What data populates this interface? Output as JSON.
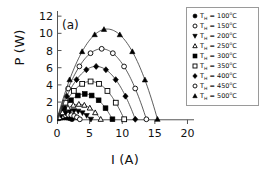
{
  "figure": {
    "panel_label": "(a)"
  },
  "chart_data": {
    "type": "line",
    "title": "",
    "xlabel": "I (A)",
    "ylabel": "P (W)",
    "xlim": [
      0,
      21
    ],
    "ylim": [
      -0.55,
      12.6
    ],
    "xticks": [
      0,
      5,
      10,
      15,
      20
    ],
    "yticks": [
      0,
      2,
      4,
      6,
      8,
      10,
      12
    ],
    "xtick_labels": [
      "0",
      "5",
      "10",
      "15",
      "20"
    ],
    "ytick_labels": [
      "0",
      "2",
      "4",
      "6",
      "8",
      "10",
      "12"
    ],
    "grid": false,
    "legend_position": "upper right",
    "line_color": "#333333",
    "marker_color": "#000000",
    "axis_color": "#555555",
    "series": [
      {
        "name": "T_H = 100°C",
        "label_prefix": "T",
        "label_sub": "H",
        "label_value": " = 100",
        "label_unit": "°C",
        "marker": "filled-circle",
        "i_peak": 1.15,
        "p_peak": 0.22,
        "i_end": 2.3,
        "points_i": [
          0.29,
          0.58,
          0.86,
          1.15,
          1.44,
          1.73,
          2.01,
          2.3
        ],
        "points_p": [
          0.15,
          0.2,
          0.22,
          0.22,
          0.2,
          0.15,
          0.09,
          0.0
        ]
      },
      {
        "name": "T_H = 150°C",
        "label_prefix": "T",
        "label_sub": "H",
        "label_value": " = 150",
        "label_unit": "°C",
        "marker": "open-circle",
        "i_peak": 1.75,
        "p_peak": 0.52,
        "i_end": 3.5,
        "points_i": [
          0.44,
          0.88,
          1.31,
          1.75,
          2.19,
          2.63,
          3.06,
          3.5
        ],
        "points_p": [
          0.34,
          0.46,
          0.52,
          0.52,
          0.46,
          0.34,
          0.2,
          0.0
        ]
      },
      {
        "name": "T_H = 200°C",
        "label_prefix": "T",
        "label_sub": "H",
        "label_value": " = 200",
        "label_unit": "°C",
        "marker": "filled-triangle-down",
        "i_peak": 2.6,
        "p_peak": 1.0,
        "i_end": 5.2,
        "points_i": [
          0.65,
          1.3,
          1.95,
          2.6,
          3.25,
          3.9,
          4.55,
          5.2
        ],
        "points_p": [
          0.66,
          0.89,
          1.0,
          1.0,
          0.89,
          0.66,
          0.39,
          0.0
        ]
      },
      {
        "name": "T_H = 250°C",
        "label_prefix": "T",
        "label_sub": "H",
        "label_value": " = 250",
        "label_unit": "°C",
        "marker": "open-triangle-up",
        "i_peak": 3.35,
        "p_peak": 1.75,
        "i_end": 6.7,
        "points_i": [
          0.84,
          1.68,
          2.51,
          3.35,
          4.19,
          5.03,
          5.86,
          6.7
        ],
        "points_p": [
          1.15,
          1.56,
          1.75,
          1.75,
          1.56,
          1.15,
          0.68,
          0.0
        ]
      },
      {
        "name": "T_H = 300°C",
        "label_prefix": "T",
        "label_sub": "H",
        "label_value": " = 300",
        "label_unit": "°C",
        "marker": "filled-square",
        "i_peak": 4.25,
        "p_peak": 2.95,
        "i_end": 8.5,
        "points_i": [
          1.06,
          2.13,
          3.19,
          4.25,
          5.31,
          6.38,
          7.44,
          8.5
        ],
        "points_p": [
          1.94,
          2.62,
          2.95,
          2.95,
          2.62,
          1.94,
          1.15,
          0.0
        ]
      },
      {
        "name": "T_H = 350°C",
        "label_prefix": "T",
        "label_sub": "H",
        "label_value": " = 350",
        "label_unit": "°C",
        "marker": "open-square",
        "i_peak": 5.15,
        "p_peak": 4.4,
        "i_end": 10.3,
        "points_i": [
          1.29,
          2.58,
          3.86,
          5.15,
          6.44,
          7.73,
          9.01,
          10.3
        ],
        "points_p": [
          2.89,
          3.91,
          4.4,
          4.4,
          3.91,
          2.89,
          1.71,
          0.0
        ]
      },
      {
        "name": "T_H = 400°C",
        "label_prefix": "T",
        "label_sub": "H",
        "label_value": " = 400",
        "label_unit": "°C",
        "marker": "filled-diamond",
        "i_peak": 6.0,
        "p_peak": 6.15,
        "i_end": 12.0,
        "points_i": [
          1.5,
          3.0,
          4.5,
          6.0,
          7.5,
          9.0,
          10.5,
          12.0
        ],
        "points_p": [
          4.04,
          5.47,
          6.15,
          6.15,
          5.47,
          4.04,
          2.39,
          0.0
        ]
      },
      {
        "name": "T_H = 450°C",
        "label_prefix": "T",
        "label_sub": "H",
        "label_value": " = 450",
        "label_unit": "°C",
        "marker": "open-circle",
        "i_peak": 6.85,
        "p_peak": 8.2,
        "i_end": 13.7,
        "points_i": [
          1.71,
          3.43,
          5.14,
          6.85,
          8.56,
          10.28,
          11.99,
          13.7
        ],
        "points_p": [
          5.38,
          7.29,
          8.2,
          8.2,
          7.29,
          5.38,
          3.19,
          0.0
        ]
      },
      {
        "name": "T_H = 500°C",
        "label_prefix": "T",
        "label_sub": "H",
        "label_value": " = 500",
        "label_unit": "°C",
        "marker": "filled-triangle-up",
        "i_peak": 7.2,
        "p_peak": 10.5,
        "i_end": 15.4,
        "points_i": [
          1.93,
          3.85,
          5.78,
          7.2,
          9.63,
          11.55,
          13.48,
          15.4
        ],
        "points_p": [
          6.89,
          9.33,
          10.5,
          10.5,
          9.33,
          6.89,
          4.08,
          0.0
        ]
      }
    ]
  }
}
